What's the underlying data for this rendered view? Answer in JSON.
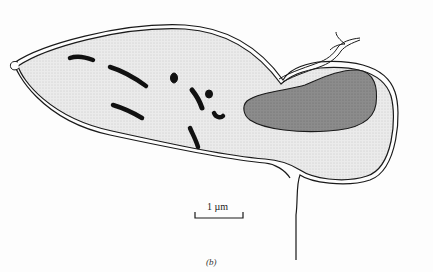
{
  "figure": {
    "panel_label": "(b)",
    "scale_bar": {
      "label": "1 µm"
    },
    "colors": {
      "cytoplasm": "#e6e6e6",
      "nucleus": "#8a8a8a",
      "organelles": "#111111",
      "outline": "#1a1a1a",
      "background": "#fdfdfd"
    },
    "components": [
      "cell-membrane",
      "cell-wall",
      "cytoplasm",
      "nucleus",
      "rod-organelles",
      "flagellum-tip",
      "trailing-process"
    ]
  }
}
